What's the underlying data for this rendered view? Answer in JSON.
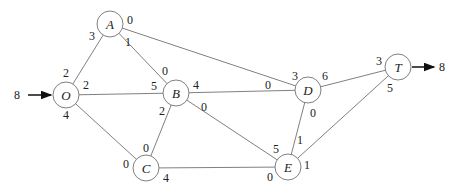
{
  "diagram": {
    "type": "network-flow",
    "source": {
      "label": "8",
      "node": "O"
    },
    "sink": {
      "label": "8",
      "node": "T"
    },
    "nodes": [
      {
        "id": "O",
        "label": "O",
        "x": 66,
        "y": 95
      },
      {
        "id": "A",
        "label": "A",
        "x": 110,
        "y": 24
      },
      {
        "id": "B",
        "label": "B",
        "x": 176,
        "y": 93
      },
      {
        "id": "C",
        "label": "C",
        "x": 146,
        "y": 168
      },
      {
        "id": "D",
        "label": "D",
        "x": 308,
        "y": 90
      },
      {
        "id": "E",
        "label": "E",
        "x": 288,
        "y": 167
      },
      {
        "id": "T",
        "label": "T",
        "x": 398,
        "y": 67
      }
    ],
    "edges": [
      {
        "from": "O",
        "to": "A",
        "from_label": "2",
        "to_label": "3"
      },
      {
        "from": "O",
        "to": "B",
        "from_label": "2",
        "to_label": "5"
      },
      {
        "from": "O",
        "to": "C",
        "from_label": "4",
        "to_label": "0"
      },
      {
        "from": "A",
        "to": "B",
        "from_label": "1",
        "to_label": "0"
      },
      {
        "from": "A",
        "to": "D",
        "from_label": "0",
        "to_label": "3"
      },
      {
        "from": "B",
        "to": "C",
        "from_label": "2",
        "to_label": "0"
      },
      {
        "from": "B",
        "to": "D",
        "from_label": "4",
        "to_label": "0"
      },
      {
        "from": "B",
        "to": "E",
        "from_label": "0",
        "to_label": "5"
      },
      {
        "from": "C",
        "to": "E",
        "from_label": "4",
        "to_label": "0"
      },
      {
        "from": "D",
        "to": "E",
        "from_label": "0",
        "to_label": "1"
      },
      {
        "from": "D",
        "to": "T",
        "from_label": "6",
        "to_label": "3"
      },
      {
        "from": "E",
        "to": "T",
        "from_label": "1",
        "to_label": "5"
      }
    ]
  }
}
